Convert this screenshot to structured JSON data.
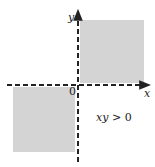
{
  "diagram": {
    "title": "",
    "axes": {
      "x_label": "x",
      "y_label": "y",
      "origin_label": "0",
      "style": "dashed",
      "arrowheads": [
        "positive-x",
        "positive-y"
      ]
    },
    "shaded_regions": [
      {
        "name": "quadrant-I",
        "description": "x > 0, y > 0"
      },
      {
        "name": "quadrant-III",
        "description": "x < 0, y < 0"
      }
    ],
    "condition_label": {
      "lhs": "xy",
      "operator": ">",
      "rhs": "0"
    },
    "colors": {
      "shade": "#d4d4d4",
      "axis": "#222222",
      "background": "#ffffff"
    }
  }
}
